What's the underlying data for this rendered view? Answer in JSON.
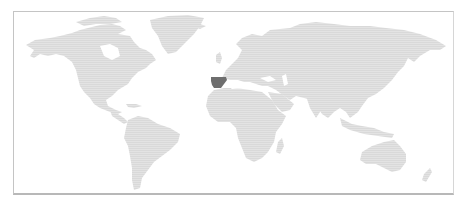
{
  "map": {
    "type": "world-choropleth",
    "projection": "equirectangular-style",
    "highlighted_country": "Spain",
    "colors": {
      "background": "#ffffff",
      "land": "#d9d9d9",
      "land_stripe": "#e6e6e6",
      "highlight": "#6e6e6e",
      "frame": "#bdbdbd"
    },
    "regions": [
      {
        "name": "North America",
        "highlighted": false
      },
      {
        "name": "Greenland",
        "highlighted": false
      },
      {
        "name": "South America",
        "highlighted": false
      },
      {
        "name": "Europe",
        "highlighted": false
      },
      {
        "name": "Spain",
        "highlighted": true
      },
      {
        "name": "Africa",
        "highlighted": false
      },
      {
        "name": "Asia",
        "highlighted": false
      },
      {
        "name": "Australia",
        "highlighted": false
      }
    ]
  }
}
